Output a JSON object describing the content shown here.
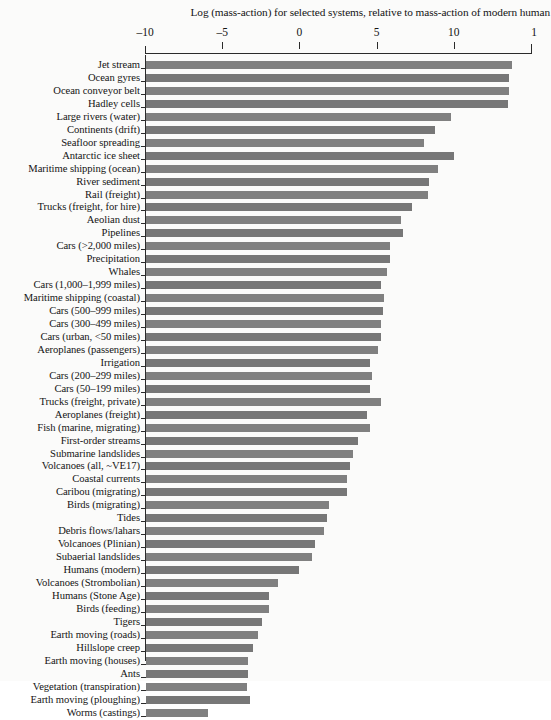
{
  "chart_data": {
    "type": "bar",
    "orientation": "horizontal",
    "title": "Log (mass-action) for selected systems, relative to mass-action of modern human",
    "xlabel": "",
    "ylabel": "",
    "xlim": [
      -10,
      15
    ],
    "xticks": [
      -10,
      -5,
      0,
      5,
      10,
      15
    ],
    "xtick_labels": [
      "–10",
      "–5",
      "0",
      "5",
      "10",
      "1"
    ],
    "grid": false,
    "legend": null,
    "baseline": -10,
    "bar_color": "#808080",
    "categories": [
      "Jet stream",
      "Ocean gyres",
      "Ocean conveyor belt",
      "Hadley cells",
      "Large rivers (water)",
      "Continents (drift)",
      "Seafloor spreading",
      "Antarctic ice sheet",
      "Maritime shipping (ocean)",
      "River sediment",
      "Rail (freight)",
      "Trucks (freight, for hire)",
      "Aeolian dust",
      "Pipelines",
      "Cars (>2,000 miles)",
      "Precipitation",
      "Whales",
      "Cars (1,000–1,999 miles)",
      "Maritime shipping (coastal)",
      "Cars (500–999 miles)",
      "Cars (300–499 miles)",
      "Cars (urban, <50 miles)",
      "Aeroplanes (passengers)",
      "Irrigation",
      "Cars (200–299 miles)",
      "Cars (50–199 miles)",
      "Trucks (freight, private)",
      "Aeroplanes (freight)",
      "Fish (marine, migrating)",
      "First-order streams",
      "Submarine landslides",
      "Volcanoes (all, ~VE17)",
      "Coastal currents",
      "Caribou (migrating)",
      "Birds (migrating)",
      "Tides",
      "Debris flows/lahars",
      "Volcanoes (Plinian)",
      "Subaerial landslides",
      "Humans (modern)",
      "Volcanoes (Strombolian)",
      "Humans (Stone Age)",
      "Birds (feeding)",
      "Tigers",
      "Earth moving (roads)",
      "Hillslope creep",
      "Earth moving (houses)",
      "Ants",
      "Vegetation (transpiration)",
      "Earth moving (ploughing)",
      "Worms (castings)"
    ],
    "values": [
      13.8,
      13.6,
      13.6,
      13.5,
      9.8,
      8.8,
      8.1,
      10.0,
      9.0,
      8.4,
      8.3,
      7.3,
      6.6,
      6.7,
      5.9,
      5.9,
      5.7,
      5.3,
      5.5,
      5.4,
      5.3,
      5.3,
      5.1,
      4.6,
      4.7,
      4.6,
      5.3,
      4.4,
      4.6,
      3.8,
      3.5,
      3.3,
      3.1,
      3.1,
      1.9,
      1.8,
      1.6,
      1.0,
      0.8,
      0.0,
      -1.4,
      -2.0,
      -2.0,
      -2.4,
      -2.7,
      -3.0,
      -3.3,
      -3.3,
      -3.4,
      -3.2,
      -5.9
    ]
  },
  "axis": {
    "tick_values": [
      -10,
      -5,
      0,
      5,
      10,
      15
    ],
    "tick_labels": [
      "–10",
      "–5",
      "0",
      "5",
      "10",
      "1"
    ]
  }
}
